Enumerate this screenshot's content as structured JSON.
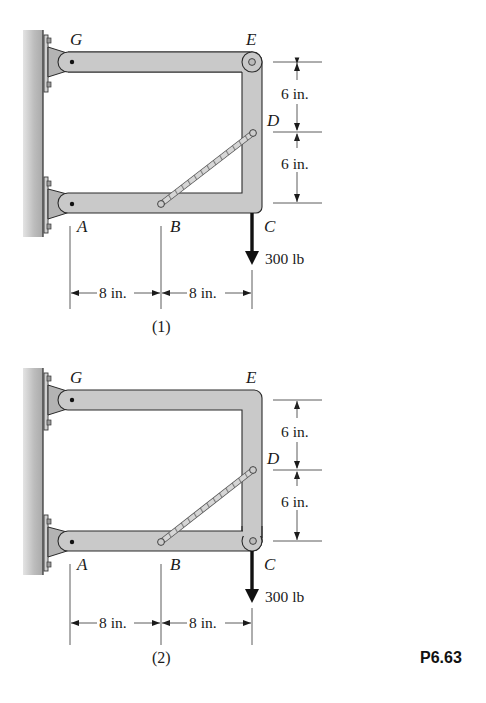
{
  "problem_id": "P6.63",
  "colors": {
    "member_fill": "#c9c9c9",
    "member_stroke": "#2a2a2a",
    "wall_fill": "#bdbdbd",
    "bracket_fill": "#b5b5b5",
    "ink": "#1a1a1a"
  },
  "figures": [
    {
      "caption": "(1)",
      "points": {
        "G": "G",
        "E": "E",
        "D": "D",
        "A": "A",
        "B": "B",
        "C": "C"
      },
      "load": "300 lb",
      "dims_vertical": [
        "6 in.",
        "6 in."
      ],
      "dims_horizontal": [
        "8 in.",
        "8 in."
      ],
      "pin_at": "E"
    },
    {
      "caption": "(2)",
      "points": {
        "G": "G",
        "E": "E",
        "D": "D",
        "A": "A",
        "B": "B",
        "C": "C"
      },
      "load": "300 lb",
      "dims_vertical": [
        "6 in.",
        "6 in."
      ],
      "dims_horizontal": [
        "8 in.",
        "8 in."
      ],
      "pin_at": "C"
    }
  ]
}
